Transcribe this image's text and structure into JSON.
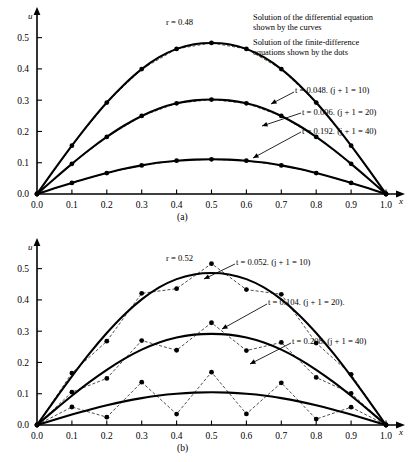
{
  "figure": {
    "legend": {
      "line1": "Solution of the differential equation",
      "line2": "shown by the curves",
      "line3": "Solution of the finite-difference",
      "line4": "equations shown by the dots"
    }
  },
  "panels": [
    {
      "id": "a",
      "caption": "(a)",
      "r_label": "r = 0.48",
      "xlabel": "x",
      "ylabel": "u",
      "xticks": [
        "0.0",
        "0.1",
        "0.2",
        "0.3",
        "0.4",
        "0.5",
        "0.6",
        "0.7",
        "0.8",
        "0.9",
        "1.0"
      ],
      "yticks": [
        "0.0",
        "0.1",
        "0.2",
        "0.3",
        "0.4",
        "0.5"
      ],
      "curve_labels": [
        "t = 0.048.  (j + 1 = 10)",
        "t = 0.096. (j + 1 = 20)",
        "t = 0.192.  (j + 1 = 40)"
      ]
    },
    {
      "id": "b",
      "caption": "(b)",
      "r_label": "r = 0.52",
      "xlabel": "x",
      "ylabel": "u",
      "xticks": [
        "0.0",
        "0.1",
        "0.2",
        "0.3",
        "0.4",
        "0.5",
        "0.6",
        "0.7",
        "0.8",
        "0.9",
        "1.0"
      ],
      "yticks": [
        "0.0",
        "0.1",
        "0.2",
        "0.3",
        "0.4",
        "0.5"
      ],
      "curve_labels": [
        "t = 0.052.  (j + 1 = 10)",
        "t = 0.104.  (j + 1 = 20).",
        "t = 0.208.  (j + 1 = 40)"
      ]
    }
  ],
  "chart_data": [
    {
      "type": "line",
      "panel": "a",
      "title": "r = 0.48",
      "subtitle": "Stable explicit finite-difference solution",
      "xlabel": "x",
      "ylabel": "u",
      "xlim": [
        0,
        1
      ],
      "ylim": [
        0,
        0.55
      ],
      "xticks": [
        0,
        0.1,
        0.2,
        0.3,
        0.4,
        0.5,
        0.6,
        0.7,
        0.8,
        0.9,
        1.0
      ],
      "yticks": [
        0,
        0.1,
        0.2,
        0.3,
        0.4,
        0.5
      ],
      "grid": false,
      "legend_position": "upper-right",
      "r": 0.48,
      "x": [
        0,
        0.05,
        0.1,
        0.15,
        0.2,
        0.25,
        0.3,
        0.35,
        0.4,
        0.45,
        0.5,
        0.55,
        0.6,
        0.65,
        0.7,
        0.75,
        0.8,
        0.85,
        0.9,
        0.95,
        1.0
      ],
      "series": [
        {
          "name": "t = 0.048. (j + 1 = 10)",
          "t": 0.048,
          "j_plus_1": 10,
          "curve": [
            0,
            0.0785,
            0.1545,
            0.2265,
            0.2925,
            0.3505,
            0.3995,
            0.4375,
            0.464,
            0.479,
            0.483,
            0.479,
            0.464,
            0.4375,
            0.3995,
            0.3505,
            0.2925,
            0.2265,
            0.1545,
            0.0785,
            0
          ],
          "dots_x": [
            0,
            0.1,
            0.2,
            0.3,
            0.4,
            0.5,
            0.6,
            0.7,
            0.8,
            0.9,
            1.0
          ],
          "dots_y": [
            0,
            0.1545,
            0.2925,
            0.3995,
            0.464,
            0.483,
            0.464,
            0.3995,
            0.2925,
            0.1545,
            0
          ]
        },
        {
          "name": "t = 0.096. (j + 1 = 20)",
          "t": 0.096,
          "j_plus_1": 20,
          "curve": [
            0,
            0.049,
            0.0965,
            0.1415,
            0.1825,
            0.219,
            0.2495,
            0.2735,
            0.29,
            0.2995,
            0.302,
            0.2995,
            0.29,
            0.2735,
            0.2495,
            0.219,
            0.1825,
            0.1415,
            0.0965,
            0.049,
            0
          ],
          "dots_x": [
            0,
            0.1,
            0.2,
            0.3,
            0.4,
            0.5,
            0.6,
            0.7,
            0.8,
            0.9,
            1.0
          ],
          "dots_y": [
            0,
            0.0965,
            0.1825,
            0.2495,
            0.29,
            0.302,
            0.29,
            0.2495,
            0.1825,
            0.0965,
            0
          ]
        },
        {
          "name": "t = 0.192. (j + 1 = 40)",
          "t": 0.192,
          "j_plus_1": 40,
          "curve": [
            0,
            0.018,
            0.0355,
            0.052,
            0.067,
            0.0805,
            0.0915,
            0.1005,
            0.1065,
            0.11,
            0.111,
            0.11,
            0.1065,
            0.1005,
            0.0915,
            0.0805,
            0.067,
            0.052,
            0.0355,
            0.018,
            0
          ],
          "dots_x": [
            0,
            0.1,
            0.2,
            0.3,
            0.4,
            0.5,
            0.6,
            0.7,
            0.8,
            0.9,
            1.0
          ],
          "dots_y": [
            0,
            0.0355,
            0.067,
            0.0915,
            0.1065,
            0.111,
            0.1065,
            0.0915,
            0.067,
            0.0355,
            0
          ]
        }
      ]
    },
    {
      "type": "line",
      "panel": "b",
      "title": "r = 0.52",
      "subtitle": "Unstable explicit finite-difference solution (oscillating dots)",
      "xlabel": "x",
      "ylabel": "u",
      "xlim": [
        0,
        1
      ],
      "ylim": [
        0,
        0.55
      ],
      "xticks": [
        0,
        0.1,
        0.2,
        0.3,
        0.4,
        0.5,
        0.6,
        0.7,
        0.8,
        0.9,
        1.0
      ],
      "yticks": [
        0,
        0.1,
        0.2,
        0.3,
        0.4,
        0.5
      ],
      "grid": false,
      "legend_position": "upper-right",
      "r": 0.52,
      "x": [
        0,
        0.05,
        0.1,
        0.15,
        0.2,
        0.25,
        0.3,
        0.35,
        0.4,
        0.45,
        0.5,
        0.55,
        0.6,
        0.65,
        0.7,
        0.75,
        0.8,
        0.85,
        0.9,
        0.95,
        1.0
      ],
      "series": [
        {
          "name": "t = 0.052. (j + 1 = 10)",
          "t": 0.052,
          "j_plus_1": 10,
          "curve": [
            0,
            0.079,
            0.1555,
            0.228,
            0.294,
            0.3525,
            0.4015,
            0.44,
            0.4665,
            0.4815,
            0.486,
            0.4815,
            0.4665,
            0.44,
            0.4015,
            0.3525,
            0.294,
            0.228,
            0.1555,
            0.079,
            0
          ],
          "dots_x": [
            0,
            0.1,
            0.2,
            0.3,
            0.4,
            0.5,
            0.6,
            0.7,
            0.8,
            0.9,
            1.0
          ],
          "dots_y": [
            0,
            0.166,
            0.268,
            0.421,
            0.436,
            0.516,
            0.433,
            0.418,
            0.262,
            0.162,
            0
          ]
        },
        {
          "name": "t = 0.104. (j + 1 = 20)",
          "t": 0.104,
          "j_plus_1": 20,
          "curve": [
            0,
            0.0475,
            0.0935,
            0.137,
            0.1765,
            0.2115,
            0.241,
            0.264,
            0.28,
            0.289,
            0.2915,
            0.289,
            0.28,
            0.264,
            0.241,
            0.2115,
            0.1765,
            0.137,
            0.0935,
            0.0475,
            0
          ],
          "dots_x": [
            0,
            0.1,
            0.2,
            0.3,
            0.4,
            0.5,
            0.6,
            0.7,
            0.8,
            0.9,
            1.0
          ],
          "dots_y": [
            0,
            0.105,
            0.149,
            0.27,
            0.239,
            0.327,
            0.238,
            0.264,
            0.152,
            0.101,
            0
          ]
        },
        {
          "name": "t = 0.208. (j + 1 = 40)",
          "t": 0.208,
          "j_plus_1": 40,
          "curve": [
            0,
            0.017,
            0.0335,
            0.049,
            0.063,
            0.0755,
            0.086,
            0.0945,
            0.1,
            0.1035,
            0.1045,
            0.1035,
            0.1,
            0.0945,
            0.086,
            0.0755,
            0.063,
            0.049,
            0.0335,
            0.017,
            0
          ],
          "dots_x": [
            0,
            0.1,
            0.2,
            0.3,
            0.4,
            0.5,
            0.6,
            0.7,
            0.8,
            0.9,
            1.0
          ],
          "dots_y": [
            0,
            0.0575,
            0.025,
            0.137,
            0.035,
            0.169,
            0.0355,
            0.135,
            0.019,
            0.057,
            0
          ]
        }
      ]
    }
  ]
}
